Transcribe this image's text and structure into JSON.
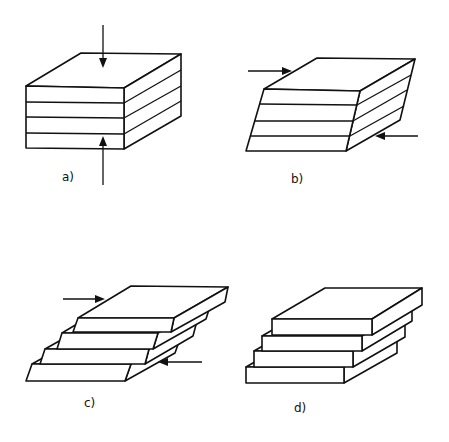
{
  "panels": [
    {
      "id": "a",
      "label": "a)",
      "description": "Stack of four layers under vertical compression (arrows from top and bottom)"
    },
    {
      "id": "b",
      "label": "b)",
      "description": "Layer stack sheared into a parallelogram by opposing horizontal forces"
    },
    {
      "id": "c",
      "label": "c)",
      "description": "Layers slipping relative to each other under shear, forming steps"
    },
    {
      "id": "d",
      "label": "d)",
      "description": "Separated layers offset in a staircase arrangement"
    }
  ],
  "colors": {
    "line": "#111111",
    "background": "#ffffff"
  }
}
